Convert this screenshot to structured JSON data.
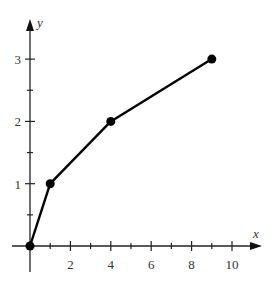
{
  "chart_data": {
    "type": "line",
    "title": "",
    "xlabel": "x",
    "ylabel": "y",
    "x": [
      0,
      1,
      4,
      9
    ],
    "series": [
      {
        "name": "y = sqrt(x)",
        "values": [
          0,
          1,
          2,
          3
        ]
      }
    ],
    "xlim": [
      -1,
      11
    ],
    "ylim": [
      -0.5,
      3.7
    ],
    "x_ticks_major": [
      2,
      4,
      6,
      8,
      10
    ],
    "x_ticks_minor": [
      1,
      3,
      5,
      7,
      9
    ],
    "x_tick_labels": [
      "2",
      "4",
      "6",
      "8",
      "10"
    ],
    "y_ticks_major": [
      1,
      2,
      3
    ],
    "y_ticks_minor": [
      0.5,
      1.5,
      2.5
    ],
    "y_tick_labels": [
      "1",
      "2",
      "3"
    ],
    "grid": false,
    "legend": false,
    "markers": "filled-circle",
    "color": "#000000"
  }
}
